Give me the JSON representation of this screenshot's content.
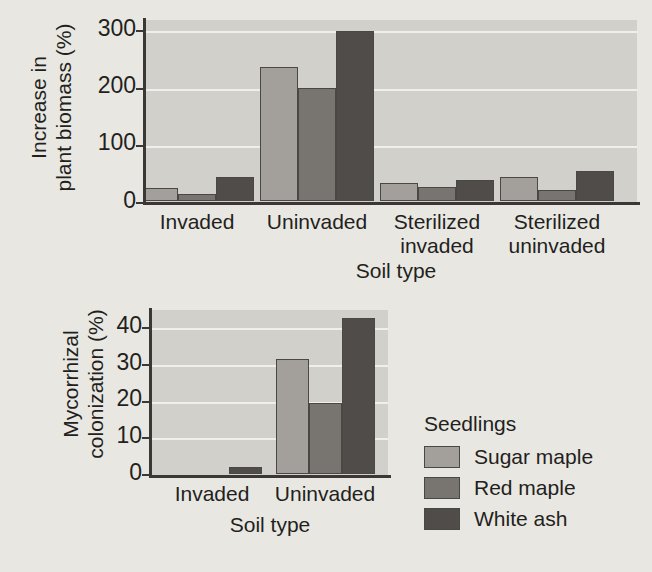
{
  "legend": {
    "title": "Seedlings",
    "entries": [
      {
        "label": "Sugar maple",
        "color": "#a3a09b"
      },
      {
        "label": "Red maple",
        "color": "#787571"
      },
      {
        "label": "White ash",
        "color": "#4f4c49"
      }
    ]
  },
  "chart_data": [
    {
      "type": "bar",
      "name": "increase-in-plant-biomass",
      "title": "",
      "xlabel": "Soil type",
      "ylabel": "Increase in\nplant biomass (%)",
      "categories": [
        "Invaded",
        "Uninvaded",
        "Sterilized\ninvaded",
        "Sterilized\nuninvaded"
      ],
      "series": [
        {
          "name": "Sugar maple",
          "color": "#a3a09b",
          "values": [
            23,
            235,
            32,
            42
          ]
        },
        {
          "name": "Red maple",
          "color": "#787571",
          "values": [
            13,
            197,
            24,
            20
          ]
        },
        {
          "name": "White ash",
          "color": "#4f4c49",
          "values": [
            42,
            298,
            37,
            52
          ]
        }
      ],
      "yticks": [
        0,
        100,
        200,
        300
      ],
      "ylim": [
        0,
        320
      ],
      "grid": true,
      "legend_position": "outside-bottom-right"
    },
    {
      "type": "bar",
      "name": "mycorrhizal-colonization",
      "title": "",
      "xlabel": "Soil type",
      "ylabel": "Mycorrhizal\ncolonization (%)",
      "categories": [
        "Invaded",
        "Uninvaded"
      ],
      "series": [
        {
          "name": "Sugar maple",
          "color": "#a3a09b",
          "values": [
            0,
            31.5
          ]
        },
        {
          "name": "Red maple",
          "color": "#787571",
          "values": [
            0,
            19.5
          ]
        },
        {
          "name": "White ash",
          "color": "#4f4c49",
          "values": [
            2,
            42.5
          ]
        }
      ],
      "yticks": [
        0,
        10,
        20,
        30,
        40
      ],
      "ylim": [
        0,
        45
      ],
      "grid": true,
      "legend_position": "outside-right"
    }
  ]
}
